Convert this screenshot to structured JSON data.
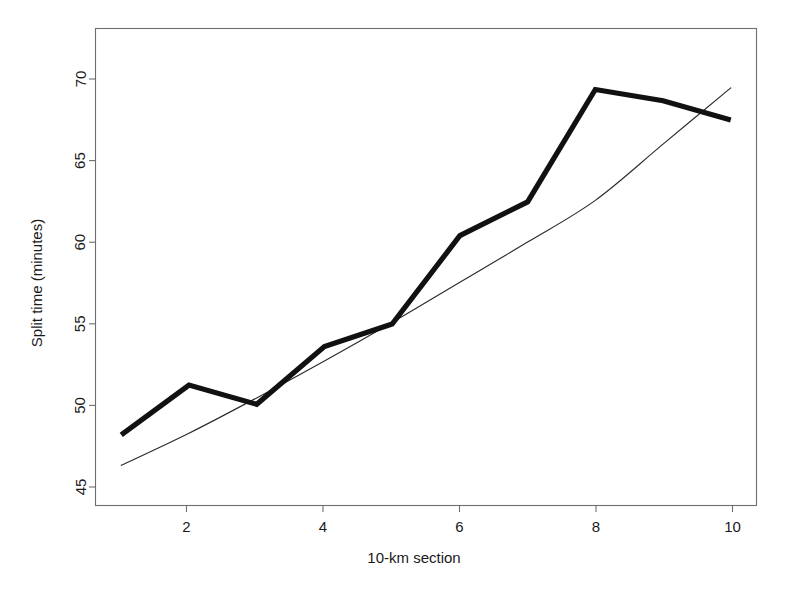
{
  "chart_data": {
    "type": "line",
    "title": "",
    "subtitle": "",
    "xlabel": "10-km section",
    "ylabel": "Split time (minutes)",
    "xlim": [
      0.62,
      10.38
    ],
    "ylim": [
      43.4,
      73.1
    ],
    "xticks": [
      2,
      4,
      6,
      8,
      10
    ],
    "xtick_labels": [
      "2",
      "4",
      "6",
      "8",
      "10"
    ],
    "yticks": [
      45,
      50,
      55,
      60,
      65,
      70
    ],
    "ytick_labels": [
      "45",
      "50",
      "55",
      "60",
      "65",
      "70"
    ],
    "grid": false,
    "legend": "none",
    "box": "full-rectangle",
    "x": [
      1,
      2,
      3,
      4,
      5,
      6,
      7,
      8,
      9,
      10
    ],
    "series": [
      {
        "name": "Observed split time",
        "style": "thick-solid",
        "color": "#111111",
        "linewidth": 5.2,
        "values": [
          47.8,
          50.9,
          49.7,
          53.3,
          54.7,
          60.2,
          62.3,
          69.3,
          68.6,
          67.4
        ]
      },
      {
        "name": "Fitted smooth curve",
        "style": "thin-solid",
        "color": "#2b2b2b",
        "linewidth": 1.15,
        "values": [
          45.9,
          47.9,
          50.1,
          52.4,
          54.8,
          57.3,
          59.8,
          62.4,
          65.9,
          69.4
        ]
      }
    ]
  },
  "axes": {
    "x_title": "10-km section",
    "y_title": "Split time (minutes)",
    "x_tick_labels": [
      "2",
      "4",
      "6",
      "8",
      "10"
    ],
    "y_tick_labels": [
      "45",
      "50",
      "55",
      "60",
      "65",
      "70"
    ]
  },
  "colors": {
    "background": "#ffffff",
    "axis": "#6e6e6e",
    "observed_series": "#111111",
    "fitted_series": "#2b2b2b",
    "text": "#1a1a1a"
  }
}
